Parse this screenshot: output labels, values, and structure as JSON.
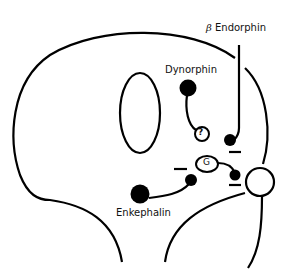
{
  "diagram": {
    "type": "neuron-opioid-modulation",
    "labels": {
      "beta_endorphin": "Endorphin",
      "beta_symbol": "β",
      "dynorphin": "Dynorphin",
      "enkephalin": "Enkephalin",
      "g_protein": "G",
      "unknown": "?"
    },
    "inhibitory_marks": [
      "−",
      "−",
      "−"
    ],
    "colors": {
      "stroke": "#000000",
      "fill": "#000000",
      "background": "#ffffff"
    }
  }
}
